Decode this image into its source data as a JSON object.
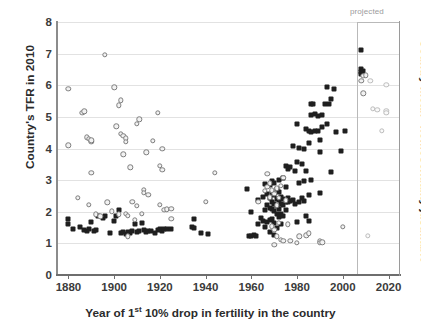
{
  "axes": {
    "ylabel_left": "Country's TFR in 2010",
    "ylabel_right": "Country mean \"homosexuality justifiable\"",
    "xlabel_pre": "Year of 1",
    "xlabel_sup": "st",
    "xlabel_post": " 10% drop in fertility in the country",
    "xlabel_full": "Year of 1st 10% drop in fertility in the country"
  },
  "annotations": {
    "projected": "projected",
    "projected_year": 2010
  },
  "colors": {
    "series_tfr": "#1f1f1f",
    "series_homosexuality": "#7d7d7d",
    "gridline": "#e2e2e2",
    "axis": "#6e6e6e",
    "projected_divider": "#b9b9b9",
    "text": "#2b2b2b",
    "background": "#ffffff"
  },
  "chart_data": {
    "type": "scatter",
    "title": "",
    "xlabel": "Year of 1st 10% drop in fertility in the country",
    "ylabel": "Country's TFR in 2010",
    "ylabel_secondary": "Country mean \"homosexuality justifiable\"",
    "xlim": [
      1875,
      2025
    ],
    "ylim": [
      0,
      8
    ],
    "xticks": [
      1880,
      1900,
      1920,
      1940,
      1960,
      1980,
      2000,
      2020
    ],
    "yticks": [
      0,
      1,
      2,
      3,
      4,
      5,
      6,
      7,
      8
    ],
    "grid": "horizontal",
    "legend_position": "none",
    "annotations": [
      {
        "text": "projected",
        "x": 2010,
        "note": "vertical divider marking projected region to the right of 2010"
      }
    ],
    "series": [
      {
        "name": "Country's TFR in 2010",
        "marker": "filled-diamond",
        "color": "#1f1f1f",
        "axis": "left",
        "points": [
          [
            1880,
            1.78
          ],
          [
            1880,
            1.62
          ],
          [
            1882,
            1.45
          ],
          [
            1885,
            1.52
          ],
          [
            1887,
            1.42
          ],
          [
            1888,
            1.38
          ],
          [
            1889,
            1.44
          ],
          [
            1890,
            1.67
          ],
          [
            1891,
            1.4
          ],
          [
            1892,
            1.42
          ],
          [
            1893,
            1.85
          ],
          [
            1895,
            1.8
          ],
          [
            1896,
            1.88
          ],
          [
            1898,
            1.33
          ],
          [
            1900,
            1.72
          ],
          [
            1901,
            1.88
          ],
          [
            1902,
            2.05
          ],
          [
            1903,
            1.32
          ],
          [
            1904,
            1.35
          ],
          [
            1905,
            1.3
          ],
          [
            1906,
            1.36
          ],
          [
            1907,
            1.33
          ],
          [
            1908,
            1.38
          ],
          [
            1909,
            1.62
          ],
          [
            1910,
            1.36
          ],
          [
            1911,
            1.4
          ],
          [
            1912,
            1.65
          ],
          [
            1913,
            1.42
          ],
          [
            1914,
            1.36
          ],
          [
            1915,
            1.38
          ],
          [
            1916,
            1.4
          ],
          [
            1918,
            1.33
          ],
          [
            1919,
            1.42
          ],
          [
            1920,
            1.45
          ],
          [
            1921,
            1.4
          ],
          [
            1922,
            1.46
          ],
          [
            1923,
            1.44
          ],
          [
            1925,
            1.45
          ],
          [
            1934,
            1.52
          ],
          [
            1935,
            1.78
          ],
          [
            1935,
            1.48
          ],
          [
            1938,
            1.32
          ],
          [
            1941,
            1.3
          ],
          [
            1958,
            2.72
          ],
          [
            1959,
            1.22
          ],
          [
            1960,
            1.24
          ],
          [
            1960,
            1.98
          ],
          [
            1961,
            1.26
          ],
          [
            1962,
            1.22
          ],
          [
            1963,
            2.38
          ],
          [
            1963,
            1.6
          ],
          [
            1964,
            1.8
          ],
          [
            1965,
            2.48
          ],
          [
            1965,
            1.72
          ],
          [
            1966,
            2.88
          ],
          [
            1966,
            2.05
          ],
          [
            1966,
            1.52
          ],
          [
            1967,
            2.55
          ],
          [
            1967,
            2.2
          ],
          [
            1967,
            1.68
          ],
          [
            1968,
            2.84
          ],
          [
            1968,
            2.42
          ],
          [
            1968,
            2.12
          ],
          [
            1968,
            1.74
          ],
          [
            1968,
            1.36
          ],
          [
            1969,
            2.96
          ],
          [
            1969,
            2.6
          ],
          [
            1969,
            2.3
          ],
          [
            1969,
            2.08
          ],
          [
            1969,
            1.78
          ],
          [
            1970,
            2.92
          ],
          [
            1970,
            2.52
          ],
          [
            1970,
            2.25
          ],
          [
            1970,
            2.02
          ],
          [
            1970,
            1.66
          ],
          [
            1970,
            1.28
          ],
          [
            1971,
            2.72
          ],
          [
            1971,
            2.4
          ],
          [
            1971,
            2.18
          ],
          [
            1971,
            1.92
          ],
          [
            1971,
            1.48
          ],
          [
            1972,
            3.0
          ],
          [
            1972,
            2.64
          ],
          [
            1972,
            2.36
          ],
          [
            1972,
            2.1
          ],
          [
            1972,
            1.84
          ],
          [
            1973,
            2.48
          ],
          [
            1973,
            2.26
          ],
          [
            1973,
            1.94
          ],
          [
            1973,
            1.62
          ],
          [
            1974,
            3.08
          ],
          [
            1974,
            2.4
          ],
          [
            1974,
            2.22
          ],
          [
            1974,
            1.88
          ],
          [
            1975,
            3.46
          ],
          [
            1975,
            2.78
          ],
          [
            1975,
            2.32
          ],
          [
            1975,
            2.04
          ],
          [
            1976,
            3.36
          ],
          [
            1976,
            2.42
          ],
          [
            1976,
            2.3
          ],
          [
            1977,
            3.4
          ],
          [
            1977,
            2.34
          ],
          [
            1978,
            4.08
          ],
          [
            1978,
            2.38
          ],
          [
            1979,
            3.28
          ],
          [
            1979,
            2.24
          ],
          [
            1980,
            4.78
          ],
          [
            1980,
            3.58
          ],
          [
            1980,
            1.68
          ],
          [
            1981,
            4.02
          ],
          [
            1981,
            2.9
          ],
          [
            1981,
            2.3
          ],
          [
            1982,
            3.52
          ],
          [
            1982,
            2.42
          ],
          [
            1983,
            3.98
          ],
          [
            1983,
            2.98
          ],
          [
            1983,
            2.34
          ],
          [
            1984,
            4.62
          ],
          [
            1984,
            3.28
          ],
          [
            1984,
            1.86
          ],
          [
            1985,
            4.56
          ],
          [
            1985,
            4.18
          ],
          [
            1985,
            2.52
          ],
          [
            1985,
            1.72
          ],
          [
            1986,
            5.4
          ],
          [
            1986,
            5.06
          ],
          [
            1986,
            4.52
          ],
          [
            1986,
            3.0
          ],
          [
            1987,
            5.42
          ],
          [
            1988,
            5.08
          ],
          [
            1988,
            4.54
          ],
          [
            1989,
            5.02
          ],
          [
            1989,
            4.56
          ],
          [
            1990,
            4.28
          ],
          [
            1990,
            3.9
          ],
          [
            1990,
            2.58
          ],
          [
            1991,
            5.06
          ],
          [
            1991,
            4.68
          ],
          [
            1992,
            5.42
          ],
          [
            1993,
            5.95
          ],
          [
            1993,
            4.76
          ],
          [
            1994,
            5.4
          ],
          [
            1995,
            5.56
          ],
          [
            1995,
            3.26
          ],
          [
            1996,
            5.88
          ],
          [
            1997,
            4.52
          ],
          [
            1999,
            3.92
          ],
          [
            2001,
            4.56
          ],
          [
            2008,
            7.12
          ],
          [
            2008,
            6.42
          ],
          [
            2008,
            6.5
          ],
          [
            2008,
            6.36
          ],
          [
            2009,
            6.44
          ]
        ]
      },
      {
        "name": "Country mean \"homosexuality justifiable\"",
        "marker": "hollow-circle",
        "color": "#7d7d7d",
        "axis": "right",
        "points": [
          [
            1880,
            5.88
          ],
          [
            1880,
            4.1
          ],
          [
            1884,
            2.44
          ],
          [
            1886,
            5.12
          ],
          [
            1887,
            5.18
          ],
          [
            1888,
            4.36
          ],
          [
            1889,
            4.3
          ],
          [
            1889,
            2.22
          ],
          [
            1890,
            4.22
          ],
          [
            1890,
            4.26
          ],
          [
            1890,
            3.24
          ],
          [
            1892,
            1.92
          ],
          [
            1894,
            1.86
          ],
          [
            1896,
            6.96
          ],
          [
            1897,
            2.3
          ],
          [
            1899,
            2.02
          ],
          [
            1900,
            5.94
          ],
          [
            1901,
            4.7
          ],
          [
            1902,
            5.36
          ],
          [
            1902,
            1.92
          ],
          [
            1903,
            5.52
          ],
          [
            1903,
            4.46
          ],
          [
            1904,
            4.4
          ],
          [
            1904,
            3.82
          ],
          [
            1905,
            4.32
          ],
          [
            1905,
            4.22
          ],
          [
            1905,
            1.94
          ],
          [
            1906,
            1.88
          ],
          [
            1906,
            1.22
          ],
          [
            1907,
            3.4
          ],
          [
            1908,
            2.32
          ],
          [
            1909,
            1.74
          ],
          [
            1910,
            4.78
          ],
          [
            1910,
            2.18
          ],
          [
            1911,
            4.92
          ],
          [
            1912,
            1.94
          ],
          [
            1913,
            2.7
          ],
          [
            1913,
            2.6
          ],
          [
            1914,
            3.88
          ],
          [
            1915,
            2.54
          ],
          [
            1917,
            4.24
          ],
          [
            1919,
            5.12
          ],
          [
            1920,
            3.46
          ],
          [
            1920,
            2.22
          ],
          [
            1921,
            4.0
          ],
          [
            1921,
            3.32
          ],
          [
            1922,
            2.06
          ],
          [
            1923,
            2.08
          ],
          [
            1925,
            2.1
          ],
          [
            1925,
            1.78
          ],
          [
            1940,
            2.32
          ],
          [
            1944,
            3.24
          ],
          [
            1963,
            2.32
          ],
          [
            1966,
            2.66
          ],
          [
            1967,
            3.2
          ],
          [
            1967,
            2.78
          ],
          [
            1968,
            2.9
          ],
          [
            1968,
            2.46
          ],
          [
            1969,
            2.68
          ],
          [
            1969,
            1.54
          ],
          [
            1970,
            2.56
          ],
          [
            1970,
            1.42
          ],
          [
            1970,
            0.96
          ],
          [
            1971,
            2.74
          ],
          [
            1971,
            2.2
          ],
          [
            1971,
            1.22
          ],
          [
            1972,
            2.44
          ],
          [
            1972,
            1.66
          ],
          [
            1973,
            2.82
          ],
          [
            1973,
            1.12
          ],
          [
            1974,
            3.08
          ],
          [
            1974,
            1.08
          ],
          [
            1975,
            2.36
          ],
          [
            1976,
            1.6
          ],
          [
            1977,
            1.08
          ],
          [
            1980,
            1.02
          ],
          [
            1981,
            1.22
          ],
          [
            1984,
            1.26
          ],
          [
            1985,
            1.32
          ],
          [
            1990,
            1.06
          ],
          [
            1990,
            1.02
          ],
          [
            1991,
            1.04
          ],
          [
            2000,
            1.52
          ],
          [
            2008,
            6.14
          ],
          [
            2009,
            6.3
          ],
          [
            2009,
            5.74
          ],
          [
            2010,
            6.32
          ],
          [
            2011,
            1.24
          ],
          [
            2012,
            6.14
          ],
          [
            2013,
            5.26
          ],
          [
            2015,
            5.22
          ],
          [
            2017,
            4.56
          ],
          [
            2019,
            6.02
          ],
          [
            2019,
            5.2
          ],
          [
            2019,
            5.12
          ]
        ]
      }
    ]
  }
}
